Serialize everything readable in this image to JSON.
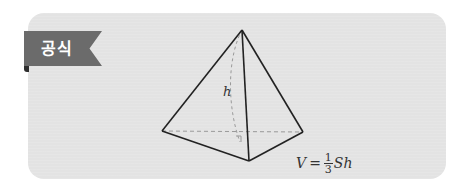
{
  "badge": {
    "label": "공식"
  },
  "figure": {
    "type": "triangular-pyramid",
    "height_label": "h",
    "vertices": {
      "apex": [
        242,
        30
      ],
      "left": [
        162,
        131
      ],
      "front": [
        249,
        161
      ],
      "right": [
        303,
        132
      ],
      "foot": [
        241,
        142
      ]
    }
  },
  "formula": {
    "lhs": "V",
    "equals": "=",
    "fraction_numerator": "1",
    "fraction_denominator": "3",
    "rhs": "Sh"
  },
  "colors": {
    "card_background": "#e3e3e3",
    "badge_background": "#6b6b6b",
    "badge_fold": "#2e2e2e",
    "line": "#222222",
    "dashed": "#9a9a9a"
  }
}
